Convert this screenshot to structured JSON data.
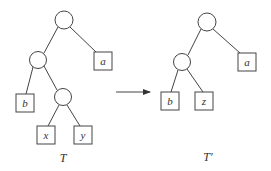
{
  "diagram": {
    "type": "tree-transformation",
    "left_tree": {
      "label": "T",
      "internal_nodes": [
        {
          "id": "root",
          "cx": 64,
          "cy": 20
        },
        {
          "id": "n1",
          "cx": 38,
          "cy": 60
        },
        {
          "id": "n2",
          "cx": 63,
          "cy": 97
        }
      ],
      "leaves": [
        {
          "id": "a",
          "label": "a",
          "x": 94,
          "y": 52
        },
        {
          "id": "b",
          "label": "b",
          "x": 16,
          "y": 94
        },
        {
          "id": "x",
          "label": "x",
          "x": 37,
          "y": 126
        },
        {
          "id": "y",
          "label": "y",
          "x": 74,
          "y": 126
        }
      ],
      "edges": [
        [
          "root",
          "n1"
        ],
        [
          "root",
          "a"
        ],
        [
          "n1",
          "b"
        ],
        [
          "n1",
          "n2"
        ],
        [
          "n2",
          "x"
        ],
        [
          "n2",
          "y"
        ]
      ]
    },
    "arrow": {
      "from_x": 116,
      "to_x": 151,
      "y": 92
    },
    "right_tree": {
      "label": "T′",
      "internal_nodes": [
        {
          "id": "root",
          "cx": 207,
          "cy": 22
        },
        {
          "id": "n1",
          "cx": 182,
          "cy": 62
        }
      ],
      "leaves": [
        {
          "id": "a",
          "label": "a",
          "x": 238,
          "y": 53
        },
        {
          "id": "b",
          "label": "b",
          "x": 161,
          "y": 92
        },
        {
          "id": "z",
          "label": "z",
          "x": 195,
          "y": 92
        }
      ],
      "edges": [
        [
          "root",
          "n1"
        ],
        [
          "root",
          "a"
        ],
        [
          "n1",
          "b"
        ],
        [
          "n1",
          "z"
        ]
      ]
    }
  }
}
